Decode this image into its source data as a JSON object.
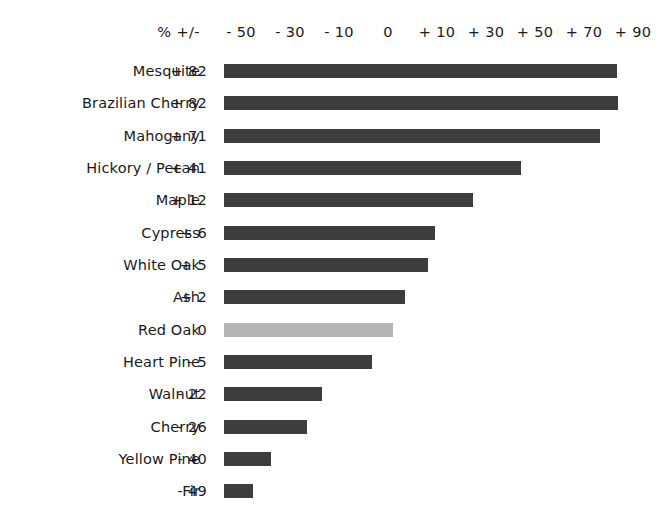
{
  "chart_data": {
    "type": "bar",
    "orientation": "horizontal",
    "title": "",
    "subtitle": "",
    "xlabel": "",
    "ylabel": "",
    "value_header": "% +/-",
    "xtick_labels": [
      "- 50",
      "- 30",
      "- 10",
      "0",
      "+ 10",
      "+ 30",
      "+ 50",
      "+ 70",
      "+ 90"
    ],
    "xtick_values": [
      -50,
      -30,
      -10,
      0,
      10,
      30,
      50,
      70,
      90
    ],
    "xtick_px": [
      241,
      290,
      339,
      388,
      437,
      486,
      535,
      584,
      633
    ],
    "xlim": [
      -60,
      95
    ],
    "grid": false,
    "legend": null,
    "bar_color": "#3d3d3d",
    "highlight_color": "#b5b5b5",
    "background": "#ffffff",
    "categories": [
      "Mesquite",
      "Brazilian Cherry",
      "Mahogany",
      "Hickory / Pecan",
      "Maple",
      "Cypress",
      "White Oak",
      "Ash",
      "Red Oak",
      "Heart Pine",
      "Walnut",
      "Cherry",
      "Yellow Pine",
      "Fir"
    ],
    "values": [
      82,
      82,
      71,
      41,
      12,
      6,
      5,
      2,
      0,
      -5,
      -22,
      -26,
      -40,
      -49
    ],
    "value_labels": [
      "+ 82",
      "+ 82",
      "+ 71",
      "+ 41",
      "+ 12",
      "+ 6",
      "+ 5",
      "+ 2",
      "0",
      "- 5",
      "- 22",
      "- 26",
      "- 40",
      "- 49"
    ],
    "bar_pixel_widths": [
      393,
      394,
      376,
      297,
      249,
      211,
      204,
      181,
      169,
      148,
      98,
      83,
      47,
      29
    ],
    "bar_colors": [
      "#3d3d3d",
      "#3d3d3d",
      "#3d3d3d",
      "#3d3d3d",
      "#3d3d3d",
      "#3d3d3d",
      "#3d3d3d",
      "#3d3d3d",
      "#b5b5b5",
      "#3d3d3d",
      "#3d3d3d",
      "#3d3d3d",
      "#3d3d3d",
      "#3d3d3d"
    ]
  },
  "rows": [
    {
      "name": "Mesquite",
      "value_label": "+ 82",
      "width": 393,
      "color": "#3d3d3d",
      "top": 61
    },
    {
      "name": "Brazilian Cherry",
      "value_label": "+ 82",
      "width": 394,
      "color": "#3d3d3d",
      "top": 93
    },
    {
      "name": "Mahogany",
      "value_label": "+ 71",
      "width": 376,
      "color": "#3d3d3d",
      "top": 126
    },
    {
      "name": "Hickory / Pecan",
      "value_label": "+ 41",
      "width": 297,
      "color": "#3d3d3d",
      "top": 158
    },
    {
      "name": "Maple",
      "value_label": "+ 12",
      "width": 249,
      "color": "#3d3d3d",
      "top": 190
    },
    {
      "name": "Cypress",
      "value_label": "+ 6",
      "width": 211,
      "color": "#3d3d3d",
      "top": 223
    },
    {
      "name": "White Oak",
      "value_label": "+ 5",
      "width": 204,
      "color": "#3d3d3d",
      "top": 255
    },
    {
      "name": "Ash",
      "value_label": "+ 2",
      "width": 181,
      "color": "#3d3d3d",
      "top": 287
    },
    {
      "name": "Red Oak",
      "value_label": "0",
      "width": 169,
      "color": "#b5b5b5",
      "top": 320
    },
    {
      "name": "Heart Pine",
      "value_label": "- 5",
      "width": 148,
      "color": "#3d3d3d",
      "top": 352
    },
    {
      "name": "Walnut",
      "value_label": "- 22",
      "width": 98,
      "color": "#3d3d3d",
      "top": 384
    },
    {
      "name": "Cherry",
      "value_label": "- 26",
      "width": 83,
      "color": "#3d3d3d",
      "top": 417
    },
    {
      "name": "Yellow Pine",
      "value_label": "- 40",
      "width": 47,
      "color": "#3d3d3d",
      "top": 449
    },
    {
      "name": "Fir",
      "value_label": "- 49",
      "width": 29,
      "color": "#3d3d3d",
      "top": 481
    }
  ],
  "ticks": [
    {
      "label": "- 50",
      "x": 241
    },
    {
      "label": "- 30",
      "x": 290
    },
    {
      "label": "- 10",
      "x": 339
    },
    {
      "label": "0",
      "x": 388
    },
    {
      "label": "+ 10",
      "x": 437
    },
    {
      "label": "+ 30",
      "x": 486
    },
    {
      "label": "+ 50",
      "x": 535
    },
    {
      "label": "+ 70",
      "x": 584
    },
    {
      "label": "+ 90",
      "x": 633
    }
  ]
}
